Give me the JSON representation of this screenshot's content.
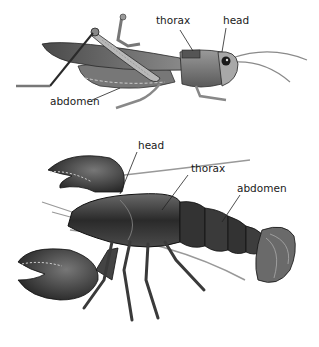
{
  "figures": [
    {
      "id": "grasshopper",
      "subject": "grasshopper",
      "labels": [
        {
          "text": "thorax",
          "x": 156,
          "y": 15
        },
        {
          "text": "head",
          "x": 223,
          "y": 15
        },
        {
          "text": "abdomen",
          "x": 50,
          "y": 96
        }
      ]
    },
    {
      "id": "lobster",
      "subject": "lobster",
      "labels": [
        {
          "text": "head",
          "x": 138,
          "y": 10
        },
        {
          "text": "thorax",
          "x": 191,
          "y": 33
        },
        {
          "text": "abdomen",
          "x": 237,
          "y": 53
        }
      ]
    }
  ],
  "colors": {
    "background": "#ffffff",
    "label_text": "#1a1a1a",
    "leader_line": "#222222",
    "body_dark": "#2b2b2b",
    "body_mid": "#6b6b6b",
    "body_light": "#bdbdbd"
  }
}
